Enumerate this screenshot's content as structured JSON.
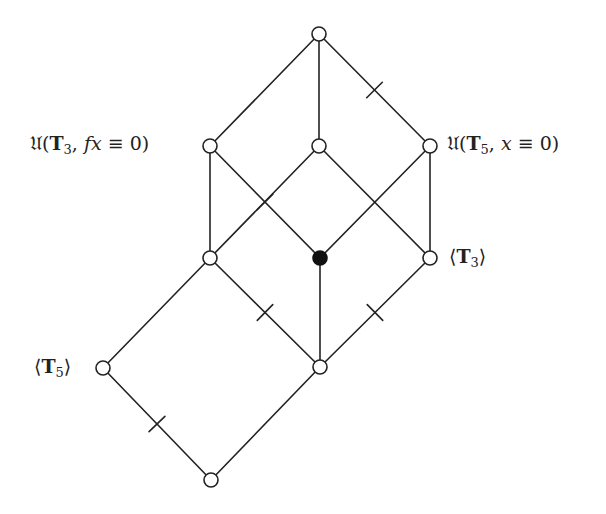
{
  "diagram": {
    "type": "lattice",
    "nodes": [
      {
        "id": "top",
        "col": 1,
        "row": 0,
        "filled": false,
        "label": ""
      },
      {
        "id": "A",
        "col": 0,
        "row": 1,
        "filled": false,
        "label": "Û(T3, fx ≡ 0)"
      },
      {
        "id": "B",
        "col": 1,
        "row": 1,
        "filled": false,
        "label": ""
      },
      {
        "id": "C",
        "col": 2,
        "row": 1,
        "filled": false,
        "label": "Û(T5, x ≡ 0)"
      },
      {
        "id": "D",
        "col": 0,
        "row": 2,
        "filled": false,
        "label": ""
      },
      {
        "id": "E",
        "col": 1,
        "row": 2,
        "filled": true,
        "label": ""
      },
      {
        "id": "F",
        "col": 2,
        "row": 2,
        "filled": false,
        "label": "⟨T3⟩"
      },
      {
        "id": "L",
        "col": -1,
        "row": 3,
        "filled": false,
        "label": "⟨T5⟩"
      },
      {
        "id": "G",
        "col": 1,
        "row": 3,
        "filled": false,
        "label": ""
      },
      {
        "id": "M",
        "col": 0,
        "row": 4,
        "filled": false,
        "label": ""
      }
    ],
    "edges": [
      {
        "from": "top",
        "to": "A",
        "tick": false
      },
      {
        "from": "top",
        "to": "B",
        "tick": false
      },
      {
        "from": "top",
        "to": "C",
        "tick": true
      },
      {
        "from": "A",
        "to": "D",
        "tick": false
      },
      {
        "from": "A",
        "to": "E",
        "tick": true
      },
      {
        "from": "B",
        "to": "D",
        "tick": false
      },
      {
        "from": "B",
        "to": "F",
        "tick": false
      },
      {
        "from": "C",
        "to": "E",
        "tick": false
      },
      {
        "from": "C",
        "to": "F",
        "tick": false
      },
      {
        "from": "D",
        "to": "G",
        "tick": true
      },
      {
        "from": "D",
        "to": "L",
        "tick": false
      },
      {
        "from": "E",
        "to": "G",
        "tick": false
      },
      {
        "from": "F",
        "to": "G",
        "tick": true
      },
      {
        "from": "L",
        "to": "M",
        "tick": true
      },
      {
        "from": "G",
        "to": "M",
        "tick": false
      }
    ]
  },
  "labels": {
    "A": {
      "hat": "𝔘",
      "open": "(",
      "bold": "T",
      "sub": "3",
      "rest_it": "fx",
      "rest": " ≡ 0)",
      "sep": ", "
    },
    "C": {
      "hat": "𝔘",
      "open": "(",
      "bold": "T",
      "sub": "5",
      "rest_it": "x",
      "rest": " ≡ 0)",
      "sep": ", "
    },
    "F": {
      "open": "⟨",
      "bold": "T",
      "sub": "3",
      "close": "⟩"
    },
    "L": {
      "open": "⟨",
      "bold": "T",
      "sub": "5",
      "close": "⟩"
    }
  },
  "colors": {
    "line": "#222222",
    "filled_node": "#111111",
    "background": "#ffffff"
  }
}
